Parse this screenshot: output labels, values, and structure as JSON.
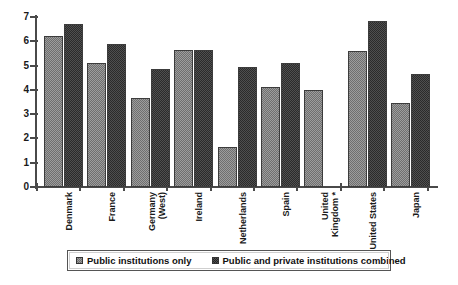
{
  "chart_data": {
    "type": "bar",
    "title": "",
    "subtitle": "",
    "xlabel": "",
    "ylabel": "",
    "ylim": [
      0,
      7
    ],
    "y_ticks": [
      "0",
      "1",
      "2",
      "3",
      "4",
      "5",
      "6",
      "7"
    ],
    "grid": false,
    "legend_position": "bottom",
    "categories": [
      "Denmark",
      "France",
      "Germany (West)",
      "Ireland",
      "Netherlands",
      "Spain",
      "United Kingdom *",
      "United States",
      "Japan"
    ],
    "category_lines": [
      [
        "Denmark"
      ],
      [
        "France"
      ],
      [
        "Germany",
        "(West)"
      ],
      [
        "Ireland"
      ],
      [
        "Netherlands"
      ],
      [
        "Spain"
      ],
      [
        "United",
        "Kingdom *"
      ],
      [
        "United States"
      ],
      [
        "Japan"
      ]
    ],
    "series": [
      {
        "name": "Public institutions only",
        "color": "#9d9d9d",
        "values": [
          6.2,
          5.1,
          3.65,
          5.65,
          1.65,
          4.1,
          4.0,
          5.6,
          3.45
        ]
      },
      {
        "name": "Public and private institutions combined",
        "color": "#4f4f4f",
        "values": [
          6.7,
          5.9,
          4.85,
          5.65,
          4.95,
          5.1,
          null,
          6.85,
          4.65
        ]
      }
    ]
  },
  "legend": {
    "entries": [
      {
        "label": "Public institutions only",
        "swatch": "light"
      },
      {
        "label": "Public and private institutions combined",
        "swatch": "dark"
      }
    ]
  }
}
